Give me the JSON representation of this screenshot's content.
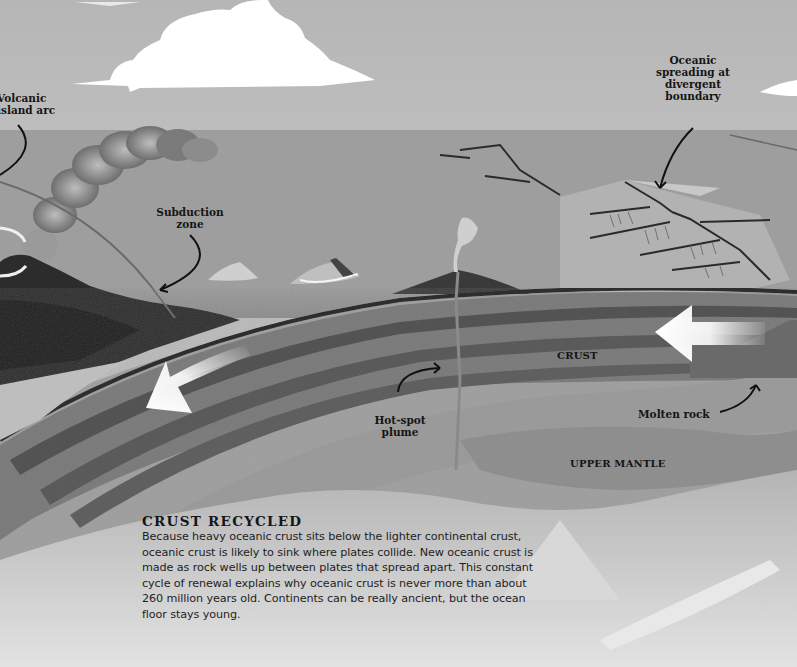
{
  "diagram": {
    "type": "cross-section illustration",
    "color_mode": "grayscale",
    "colors": {
      "sky": "#b9b9b9",
      "ocean_surface": "#8c8c8c",
      "crust": "#7d7d7d",
      "crust_dark_bands": "#4a4a4a",
      "mantle": "#a3a3a3",
      "deep_mantle": "#d4d4d4",
      "arrows": "#f4f4f4",
      "label_text": "#151515"
    }
  },
  "callouts": {
    "volcanic_island_arc": "Volcanic\nisland arc",
    "volcanic_island_arc_line1": "Volcanic",
    "volcanic_island_arc_line2": "island arc",
    "subduction_zone_line1": "Subduction",
    "subduction_zone_line2": "zone",
    "oceanic_spreading_line1": "Oceanic",
    "oceanic_spreading_line2": "spreading at",
    "oceanic_spreading_line3": "divergent",
    "oceanic_spreading_line4": "boundary",
    "hot_spot_line1": "Hot-spot",
    "hot_spot_line2": "plume",
    "molten_rock": "Molten rock"
  },
  "layers": {
    "crust": "CRUST",
    "upper_mantle": "UPPER MANTLE"
  },
  "arrows": [
    {
      "name": "subducting-plate-arrow",
      "direction": "down-left"
    },
    {
      "name": "spreading-plate-arrow",
      "direction": "left"
    }
  ],
  "info_box": {
    "title": "CRUST RECYCLED",
    "body": "Because heavy oceanic crust sits below the lighter continental crust, oceanic crust is likely to sink where plates collide. New oceanic crust is made as rock wells up between plates that spread apart. This constant cycle of renewal explains why oceanic crust is never more than about 260 million years old. Continents can be really ancient, but the ocean floor stays young."
  }
}
